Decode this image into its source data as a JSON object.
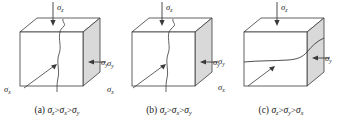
{
  "figure": {
    "background": "#ffffff",
    "line_color": "#3a3a3a",
    "face_fill_front": "#ffffff",
    "face_fill_top": "#ffffff",
    "face_fill_side": "#d9d9d9",
    "text_color": "#1a1a1a"
  },
  "symbols": {
    "sigma": "σ",
    "greater_than": ">",
    "sub_x": "x",
    "sub_y": "y",
    "sub_z": "z"
  },
  "panels": [
    {
      "id": "a",
      "caption_index": "(a)",
      "caption_terms": [
        "z",
        "x",
        "y"
      ],
      "crack_type": "vertical",
      "labels": {
        "top": {
          "sigma": "σ",
          "sub": "z"
        },
        "right": {
          "sigma": "σ",
          "sub": "y"
        },
        "left_lower": {
          "sigma": "σ",
          "sub": "x"
        }
      }
    },
    {
      "id": "b",
      "caption_index": "(b)",
      "caption_terms": [
        "z",
        "x",
        "y"
      ],
      "crack_type": "vertical",
      "labels": {
        "top": {
          "sigma": "σ",
          "sub": "z"
        },
        "right": {
          "sigma": "σ",
          "sub": "y"
        },
        "left_upper": {
          "sigma": "σ",
          "sub": "y"
        },
        "left_lower": {
          "sigma": "σ",
          "sub": "x"
        }
      }
    },
    {
      "id": "c",
      "caption_index": "(c)",
      "caption_terms": [
        "z",
        "y",
        "x"
      ],
      "crack_type": "horizontal",
      "labels": {
        "top": {
          "sigma": "σ",
          "sub": "z"
        },
        "right": {
          "sigma": "σ",
          "sub": "y"
        },
        "left_upper": {
          "sigma": "σ",
          "sub": "y"
        },
        "left_lower": {
          "sigma": "σ",
          "sub": "x"
        }
      }
    }
  ]
}
